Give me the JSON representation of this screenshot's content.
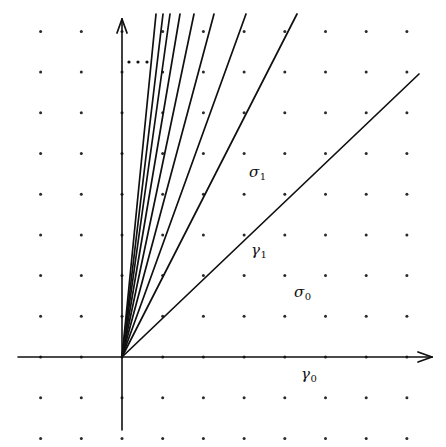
{
  "figure": {
    "type": "fan-diagram",
    "width": 446,
    "height": 447,
    "background_color": "#ffffff",
    "ink_color": "#101010",
    "origin": {
      "x": 122,
      "y": 357
    },
    "lattice": {
      "description": "grid of small dots marking integral lattice points",
      "spacing_x": 40.7,
      "spacing_y": 40.7,
      "dot_radius": 1.5,
      "dot_color": "#2a2a2a",
      "columns_left_of_origin": 3,
      "columns_right_of_origin": 8,
      "rows_above_origin": 8,
      "rows_below_origin": 2
    },
    "axes": [
      {
        "name": "x-axis",
        "from": {
          "x": 18,
          "y": 357
        },
        "to": {
          "x": 432,
          "y": 357
        },
        "arrowhead": "end",
        "stroke_width": 1.6
      },
      {
        "name": "y-axis",
        "from": {
          "x": 122,
          "y": 430
        },
        "to": {
          "x": 122,
          "y": 19
        },
        "arrowhead": "end",
        "stroke_width": 1.6
      }
    ],
    "rays": [
      {
        "id": "ray-1",
        "end": {
          "x": 156,
          "y": 14
        },
        "stroke_width": 1.7
      },
      {
        "id": "ray-2",
        "end": {
          "x": 163,
          "y": 14
        },
        "stroke_width": 1.7
      },
      {
        "id": "ray-3",
        "end": {
          "x": 170,
          "y": 14
        },
        "stroke_width": 1.7
      },
      {
        "id": "ray-4",
        "end": {
          "x": 180,
          "y": 14
        },
        "stroke_width": 1.7
      },
      {
        "id": "ray-5",
        "end": {
          "x": 194,
          "y": 14
        },
        "stroke_width": 1.7
      },
      {
        "id": "ray-6",
        "end": {
          "x": 214,
          "y": 14
        },
        "stroke_width": 1.7
      },
      {
        "id": "ray-7",
        "end": {
          "x": 246,
          "y": 14
        },
        "stroke_width": 1.7
      },
      {
        "id": "ray-8",
        "end": {
          "x": 297,
          "y": 14
        },
        "stroke_width": 1.7
      },
      {
        "id": "ray-gamma1",
        "end": {
          "x": 419,
          "y": 74
        },
        "stroke_width": 1.7
      }
    ],
    "ellipsis": {
      "name": "ray-ellipsis",
      "symbol": "⋯",
      "dots": [
        {
          "x": 129,
          "y": 62
        },
        {
          "x": 138,
          "y": 62
        },
        {
          "x": 147,
          "y": 62
        }
      ],
      "dot_radius": 1.6
    },
    "labels": [
      {
        "id": "sigma-1",
        "text": "σ",
        "sub": "1",
        "x": 249,
        "y": 165
      },
      {
        "id": "gamma-1",
        "text": "γ",
        "sub": "1",
        "x": 251,
        "y": 243
      },
      {
        "id": "sigma-0",
        "text": "σ",
        "sub": "0",
        "x": 294,
        "y": 285
      },
      {
        "id": "gamma-0",
        "text": "γ",
        "sub": "0",
        "x": 301,
        "y": 367
      }
    ]
  }
}
